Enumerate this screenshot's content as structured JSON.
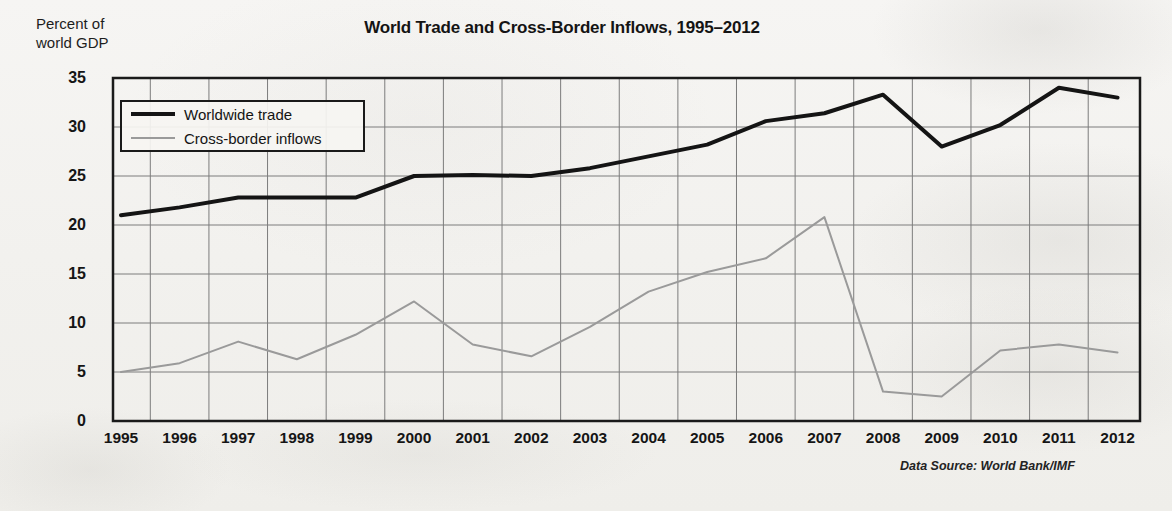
{
  "chart_data": {
    "type": "line",
    "title": "World Trade and Cross-Border Inflows, 1995–2012",
    "ylabel": "Percent of\nworld GDP",
    "xlabel": "",
    "categories": [
      "1995",
      "1996",
      "1997",
      "1998",
      "1999",
      "2000",
      "2001",
      "2002",
      "2003",
      "2004",
      "2005",
      "2006",
      "2007",
      "2008",
      "2009",
      "2010",
      "2011",
      "2012"
    ],
    "series": [
      {
        "name": "Worldwide trade",
        "color": "#141414",
        "values": [
          21.0,
          21.8,
          22.8,
          22.8,
          22.8,
          25.0,
          25.1,
          25.0,
          25.8,
          27.0,
          28.2,
          30.6,
          31.4,
          33.3,
          28.0,
          30.2,
          34.0,
          33.0
        ]
      },
      {
        "name": "Cross-border inflows",
        "color": "#9a9a9a",
        "values": [
          5.0,
          5.9,
          8.1,
          6.3,
          8.8,
          12.2,
          7.8,
          6.6,
          9.6,
          13.2,
          15.2,
          16.6,
          20.8,
          3.0,
          2.5,
          7.2,
          7.8,
          7.0
        ]
      }
    ],
    "ylim": [
      0,
      35
    ],
    "yticks": [
      0,
      5,
      10,
      15,
      20,
      25,
      30,
      35
    ],
    "grid": true,
    "legend_position": "upper-left-inside",
    "source_note": "Data Source: World Bank/IMF"
  },
  "legend": {
    "items": [
      {
        "label": "Worldwide trade"
      },
      {
        "label": "Cross-border inflows"
      }
    ]
  },
  "ghost": {
    "right_column": [
      "18,000",
      "16,000",
      "8,000",
      "6,000",
      "4,000"
    ],
    "right_column_b": [
      "2,000",
      "0"
    ],
    "bottom_years": [
      "2012",
      "2010",
      "2008",
      "2006"
    ],
    "bottom_note": "Data Source:  U.S. Department of Commerce and OECD"
  }
}
